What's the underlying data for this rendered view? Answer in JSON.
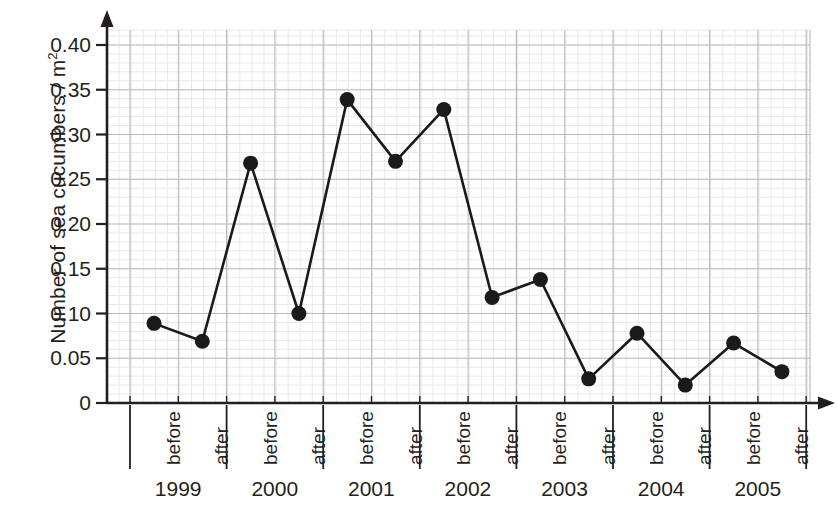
{
  "chart_data": {
    "type": "line",
    "title": "",
    "xlabel": "",
    "ylabel": "Number of sea cucumbers / m",
    "ylabel_exponent": "2",
    "ylim": [
      0,
      0.425
    ],
    "yticks": [
      0,
      0.05,
      0.1,
      0.15,
      0.2,
      0.25,
      0.3,
      0.35,
      0.4
    ],
    "ytick_labels": [
      "0",
      "0.05",
      "0.10",
      "0.15",
      "0.20",
      "0.25",
      "0.30",
      "0.35",
      "0.40"
    ],
    "grid": true,
    "minor_grid": true,
    "legend": "none",
    "groups": [
      "1999",
      "2000",
      "2001",
      "2002",
      "2003",
      "2004",
      "2005"
    ],
    "subcategories": [
      "before",
      "after"
    ],
    "categories": [
      "1999 before",
      "1999 after",
      "2000 before",
      "2000 after",
      "2001 before",
      "2001 after",
      "2002 before",
      "2002 after",
      "2003 before",
      "2003 after",
      "2004 before",
      "2004 after",
      "2005 before",
      "2005 after"
    ],
    "values": [
      0.089,
      0.069,
      0.268,
      0.1,
      0.339,
      0.27,
      0.328,
      0.118,
      0.138,
      0.027,
      0.078,
      0.02,
      0.067,
      0.035
    ],
    "marker": "filled-circle",
    "marker_color": "#1a1a1a",
    "line_color": "#1a1a1a",
    "axis_color": "#231f20",
    "grid_color": "#b9bcbe",
    "minor_grid_color": "#e8e9ea",
    "background_color": "#ffffff"
  }
}
